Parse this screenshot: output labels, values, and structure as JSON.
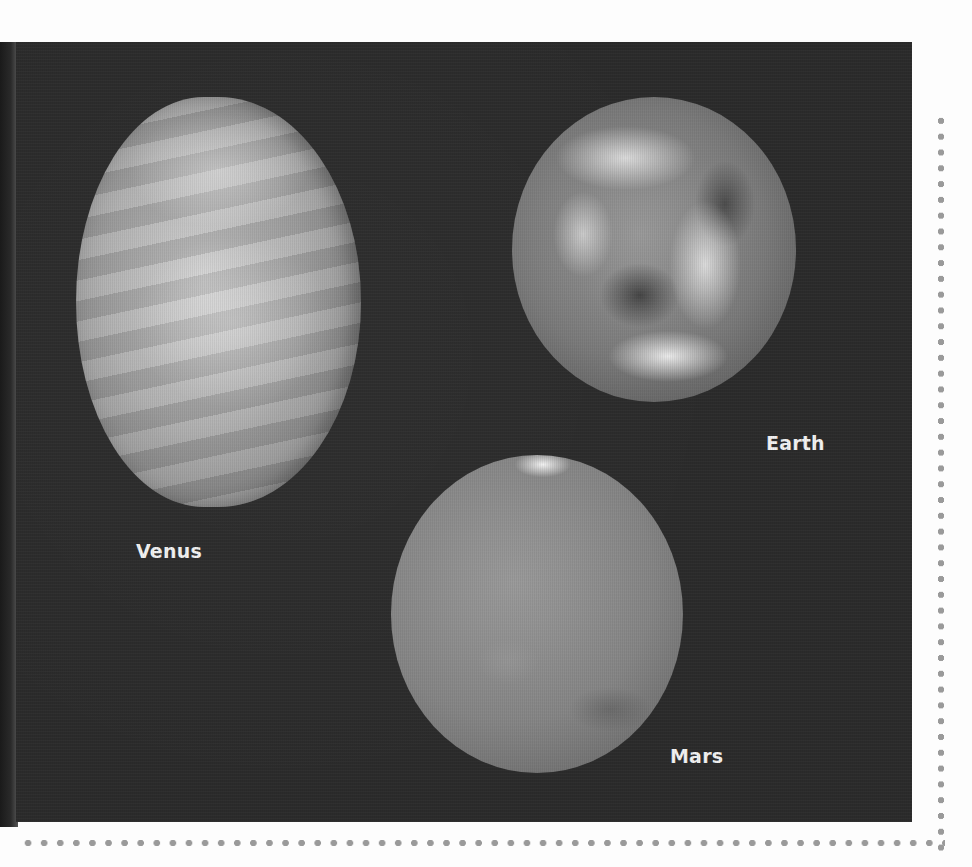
{
  "figure": {
    "labels": {
      "venus": "Venus",
      "earth": "Earth",
      "mars": "Mars"
    }
  },
  "colors": {
    "background": "#2b2b2b",
    "page": "#fdfdfd",
    "label_text": "#f2f2f2",
    "dot_border": "#9a9a9a"
  }
}
